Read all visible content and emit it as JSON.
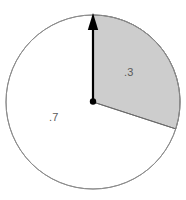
{
  "figure": {
    "type": "pie-sector-diagram",
    "background_color": "#ffffff",
    "circle": {
      "center_x": 93,
      "center_y": 102,
      "radius": 87,
      "outline_color": "#8c8c8c",
      "outline_width": 1,
      "fill_color": "#ffffff"
    },
    "shaded_sector": {
      "fill_color": "#cdcdcd",
      "edge_color": "#6b6b6b",
      "start_angle_deg": 0,
      "end_angle_deg": 108,
      "direction": "clockwise",
      "fraction": 0.3
    },
    "arrow": {
      "color": "#000000",
      "from_x": 93,
      "from_y": 102,
      "to_x": 93,
      "to_y": 16,
      "head": "triangle-up",
      "tail": "dot",
      "shaft_width": 2.2
    },
    "center_dot": {
      "color": "#000000",
      "radius": 3.2
    },
    "labels": {
      "shaded": ".3",
      "unshaded": ".7",
      "text_color": "#5a5a5a"
    }
  },
  "chart_data": {
    "type": "pie",
    "title": "",
    "categories": [
      "shaded",
      "unshaded"
    ],
    "values": [
      0.3,
      0.7
    ],
    "labels": [
      ".3",
      ".7"
    ],
    "colors": [
      "#cdcdcd",
      "#ffffff"
    ],
    "start_angle_deg": 90,
    "direction": "clockwise",
    "legend": "none",
    "grid": false,
    "annotations": [
      "arrow from center to top of circle marking 0 position"
    ]
  }
}
